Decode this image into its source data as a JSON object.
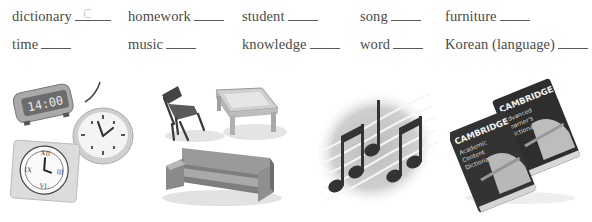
{
  "exercise": {
    "rows": [
      [
        {
          "word": "dictionary",
          "answer": "C"
        },
        {
          "word": "homework",
          "answer": ""
        },
        {
          "word": "student",
          "answer": ""
        },
        {
          "word": "song",
          "answer": ""
        },
        {
          "word": "furniture",
          "answer": ""
        }
      ],
      [
        {
          "word": "time",
          "answer": ""
        },
        {
          "word": "music",
          "answer": ""
        },
        {
          "word": "knowledge",
          "answer": ""
        },
        {
          "word": "word",
          "answer": ""
        },
        {
          "word": "Korean (language)",
          "answer": ""
        }
      ]
    ]
  },
  "pictures": {
    "clocks": {
      "digital_display": "14:00"
    },
    "furniture": {},
    "music": {},
    "dictionaries": {
      "left_book": {
        "brand": "CAMBRIDGE",
        "title": "Academic Content Dictionary"
      },
      "right_book": {
        "brand": "CAMBRIDGE",
        "title": "Advanced Learner's Dictionary"
      }
    }
  }
}
